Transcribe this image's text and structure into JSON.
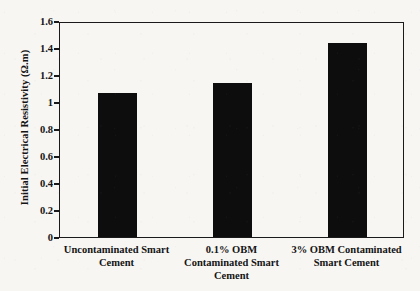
{
  "chart_data": {
    "type": "bar",
    "title": "",
    "xlabel": "",
    "ylabel": "Initial Electrical Resistivity (Ω.m)",
    "categories": [
      "Uncontaminated Smart\nCement",
      "0.1% OBM\nContaminated Smart\nCement",
      "3% OBM Contaminated\nSmart Cement"
    ],
    "values": [
      1.07,
      1.14,
      1.44
    ],
    "ylim": [
      0,
      1.6
    ],
    "ytick_labels": [
      "0",
      "0.2",
      "0.4",
      "0.6",
      "0.8",
      "1",
      "1.2",
      "1.4",
      "1.6"
    ],
    "ytick_values": [
      0,
      0.2,
      0.4,
      0.6,
      0.8,
      1,
      1.2,
      1.4,
      1.6
    ],
    "grid": false,
    "legend": "none",
    "bar_color": "#0d0d0d",
    "axis_color": "#1a1a1a",
    "background_color": "#f7f6f3"
  }
}
